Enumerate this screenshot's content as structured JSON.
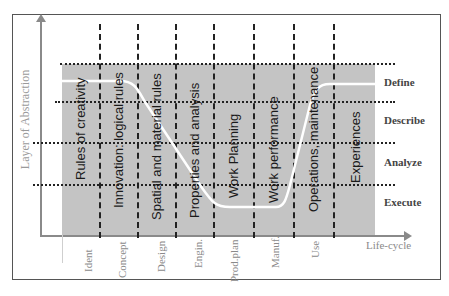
{
  "axes": {
    "y_label": "Layer of Abstraction",
    "x_label": "Life-cycle"
  },
  "levels": [
    {
      "label": "Define"
    },
    {
      "label": "Describe"
    },
    {
      "label": "Analyze"
    },
    {
      "label": "Execute"
    }
  ],
  "phases": [
    {
      "label": "Rules of creativity"
    },
    {
      "label": "Innovation: logical rules"
    },
    {
      "label": "Spatial and material rules"
    },
    {
      "label": "Properties and analysis"
    },
    {
      "label": "Work Planning"
    },
    {
      "label": "Work performance"
    },
    {
      "label": "Operations, maintenance"
    },
    {
      "label": "Experiences"
    }
  ],
  "stages": [
    {
      "label": "Ident"
    },
    {
      "label": "Concept"
    },
    {
      "label": "Design"
    },
    {
      "label": "Engin."
    },
    {
      "label": "Prod.plan"
    },
    {
      "label": "Manuf."
    },
    {
      "label": "Use"
    }
  ],
  "colors": {
    "region_fill": "#c4c4c4",
    "curve": "#ffffff",
    "axis": "#8a8a8a",
    "grid": "#222222"
  }
}
